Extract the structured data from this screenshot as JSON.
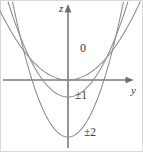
{
  "figure": {
    "background_color": "#ffffff",
    "border_color": "#d8d8d8",
    "axis_color": "#7b7b7b",
    "curve_color": "#8c8c8c",
    "label_color": "#3a3a3a",
    "width": 143,
    "height": 152
  },
  "axes": {
    "vertical": {
      "label": "z",
      "name": "z-axis",
      "x_px": 68,
      "arrow_direction": "up"
    },
    "horizontal": {
      "label": "y",
      "name": "y-axis",
      "y_px": 80,
      "arrow_direction": "right"
    },
    "origin": {
      "x_px": 68,
      "y_px": 80
    }
  },
  "curve_labels": [
    {
      "text": "0",
      "x_px": 80,
      "y_px": 42
    },
    {
      "text": "±1",
      "x_px": 75,
      "y_px": 90
    },
    {
      "text": "±2",
      "x_px": 84,
      "y_px": 127
    }
  ],
  "chart_data": {
    "type": "line",
    "title": "",
    "xlabel": "y",
    "ylabel": "z",
    "grid": false,
    "legend": "inline-curve-labels",
    "axis_ranges": {
      "y_px": [
        0,
        143
      ],
      "z_px": [
        0,
        152
      ]
    },
    "series": [
      {
        "name": "0",
        "label": "0",
        "vertex": {
          "y_px": 68,
          "z_px": 80
        },
        "curvature_px": 0.015,
        "label_position": {
          "x_px": 80,
          "y_px": 42
        }
      },
      {
        "name": "±1",
        "label": "±1",
        "vertex": {
          "y_px": 68,
          "z_px": 97
        },
        "curvature_px": 0.0265,
        "label_position": {
          "x_px": 75,
          "y_px": 90
        }
      },
      {
        "name": "±2",
        "label": "±2",
        "vertex": {
          "y_px": 68,
          "z_px": 137
        },
        "curvature_px": 0.044,
        "label_position": {
          "x_px": 84,
          "y_px": 127
        }
      }
    ]
  }
}
